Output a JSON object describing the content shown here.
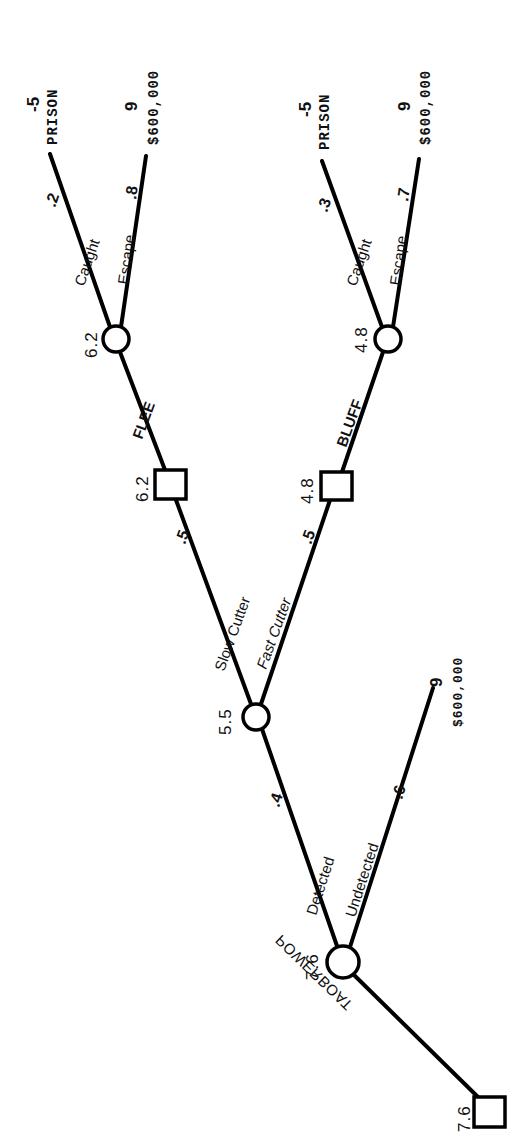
{
  "diagram": {
    "type": "decision-tree",
    "orientation": "rotated-90-ccw",
    "root": {
      "kind": "decision",
      "value": "7.6",
      "action": "POWERBOAT"
    },
    "detection_node": {
      "kind": "chance",
      "value": "7.6",
      "branches": [
        {
          "label": "Detected",
          "prob": ".4"
        },
        {
          "label": "Undetected",
          "prob": ".6",
          "payoff": "9",
          "outcome": "$600,000"
        }
      ]
    },
    "cutter_node": {
      "kind": "chance",
      "value": "5.5",
      "branches": [
        {
          "label": "Slow Cutter",
          "prob": ".5"
        },
        {
          "label": "Fast Cutter",
          "prob": ".5"
        }
      ]
    },
    "flee_decision": {
      "kind": "decision",
      "value": "6.2",
      "action": "FLEE"
    },
    "bluff_decision": {
      "kind": "decision",
      "value": "4.8",
      "action": "BLUFF"
    },
    "flee_chance": {
      "kind": "chance",
      "value": "6.2",
      "branches": [
        {
          "label": "Caught",
          "prob": ".2",
          "payoff": "-5",
          "outcome": "PRISON"
        },
        {
          "label": "Escape",
          "prob": ".8",
          "payoff": "9",
          "outcome": "$600,000"
        }
      ]
    },
    "bluff_chance": {
      "kind": "chance",
      "value": "4.8",
      "branches": [
        {
          "label": "Caught",
          "prob": ".3",
          "payoff": "-5",
          "outcome": "PRISON"
        },
        {
          "label": "Escape",
          "prob": ".7",
          "payoff": "9",
          "outcome": "$600,000"
        }
      ]
    }
  }
}
